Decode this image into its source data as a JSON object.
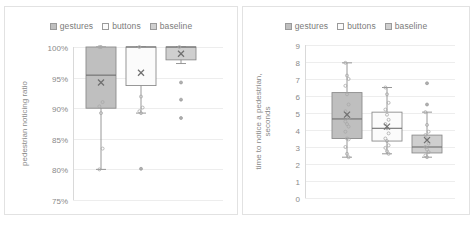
{
  "figure": {
    "background": "#ffffff",
    "panel_border": "#e2e2e2"
  },
  "legend": {
    "items": [
      {
        "label": "gestures",
        "fill": "#bfbfbf",
        "stroke": "#9a9a9a"
      },
      {
        "label": "buttons",
        "fill": "#fbfbfb",
        "stroke": "#9a9a9a"
      },
      {
        "label": "baseline",
        "fill": "#cfcfcf",
        "stroke": "#9a9a9a"
      }
    ]
  },
  "chart_data": [
    {
      "id": "pedestrian-noticing-ratio",
      "type": "box",
      "title": "",
      "xlabel": "",
      "ylabel": "pedestrian noticing ratio",
      "ylim": [
        75,
        100
      ],
      "ytick_labels": [
        "100%",
        "95%",
        "90%",
        "85%",
        "80%",
        "75%"
      ],
      "ytick_values": [
        100,
        95,
        90,
        85,
        80,
        75
      ],
      "grid": true,
      "legend_position": "top",
      "units": "percent",
      "series": [
        {
          "name": "gestures",
          "fill": "#bfbfbf",
          "stroke": "#8c8c8c",
          "min": 80.0,
          "q1": 90.0,
          "median": 95.4,
          "q3": 100.0,
          "max": 100.0,
          "mean": 94.2,
          "points": [
            100.0,
            100.0,
            91.0,
            90.3,
            89.2,
            83.4,
            80.0
          ]
        },
        {
          "name": "buttons",
          "fill": "#fbfbfb",
          "stroke": "#8c8c8c",
          "min": 89.2,
          "q1": 93.7,
          "median": 100.0,
          "q3": 100.0,
          "max": 100.0,
          "mean": 95.8,
          "points": [
            100.0,
            91.9,
            90.1,
            89.5,
            89.2
          ],
          "outliers": [
            80.1
          ]
        },
        {
          "name": "baseline",
          "fill": "#cfcfcf",
          "stroke": "#8c8c8c",
          "min": 97.3,
          "q1": 97.9,
          "median": 100.0,
          "q3": 100.0,
          "max": 100.0,
          "mean": 98.9,
          "points": [
            100.0
          ],
          "outliers": [
            94.2,
            91.4,
            88.4
          ]
        }
      ]
    },
    {
      "id": "time-to-notice-a-pedestrian",
      "type": "box",
      "title": "",
      "xlabel": "",
      "ylabel": "time to notice a pedestrian, seconds",
      "ylabel_lines": [
        "time to notice a pedestrian,",
        "seconds"
      ],
      "ylim": [
        0,
        9
      ],
      "ytick_labels": [
        "9",
        "8",
        "7",
        "6",
        "5",
        "4",
        "3",
        "2",
        "1",
        "0"
      ],
      "ytick_values": [
        9,
        8,
        7,
        6,
        5,
        4,
        3,
        2,
        1,
        0
      ],
      "grid": true,
      "legend_position": "top",
      "units": "seconds",
      "series": [
        {
          "name": "gestures",
          "fill": "#bfbfbf",
          "stroke": "#8c8c8c",
          "min": 2.4,
          "q1": 3.5,
          "median": 4.65,
          "q3": 6.2,
          "max": 7.95,
          "mean": 4.9,
          "points": [
            7.95,
            7.2,
            7.0,
            6.6,
            6.1,
            5.5,
            5.1,
            4.9,
            4.7,
            4.5,
            4.35,
            4.2,
            3.9,
            3.5,
            3.45,
            3.0,
            2.6,
            2.4
          ]
        },
        {
          "name": "buttons",
          "fill": "#fbfbfb",
          "stroke": "#8c8c8c",
          "min": 2.6,
          "q1": 3.35,
          "median": 4.1,
          "q3": 5.05,
          "max": 6.5,
          "mean": 4.2,
          "points": [
            6.5,
            6.1,
            5.6,
            5.2,
            4.9,
            4.6,
            4.35,
            4.1,
            3.8,
            3.5,
            3.35,
            3.1,
            2.95,
            2.75,
            2.6
          ]
        },
        {
          "name": "baseline",
          "fill": "#cfcfcf",
          "stroke": "#8c8c8c",
          "min": 2.4,
          "q1": 2.65,
          "median": 3.0,
          "q3": 3.7,
          "max": 5.05,
          "mean": 3.4,
          "points": [
            5.05,
            4.3,
            3.9,
            3.7,
            3.45,
            3.2,
            3.0,
            2.85,
            2.7,
            2.5,
            2.4
          ],
          "outliers": [
            6.75,
            5.5
          ]
        }
      ]
    }
  ]
}
